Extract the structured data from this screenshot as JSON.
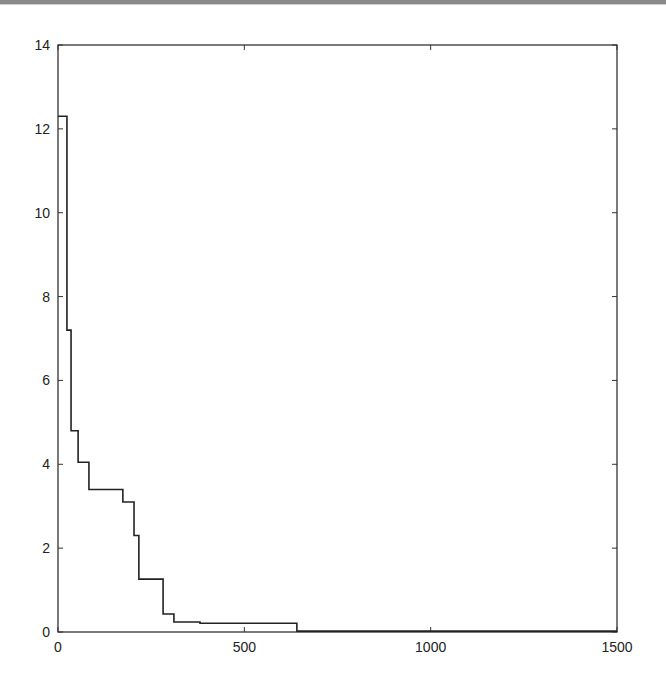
{
  "chart_data": {
    "type": "line",
    "subtype": "step",
    "title": "",
    "xlabel": "",
    "ylabel": "",
    "xlim": [
      0,
      1500
    ],
    "ylim": [
      0,
      14
    ],
    "grid": false,
    "legend": null,
    "x_ticks": [
      0,
      500,
      1000,
      1500
    ],
    "x_tick_labels": [
      "0",
      "500",
      "1000",
      "1500"
    ],
    "y_ticks": [
      0,
      2,
      4,
      6,
      8,
      10,
      12,
      14
    ],
    "y_tick_labels": [
      "0",
      "2",
      "4",
      "6",
      "8",
      "10",
      "12",
      "14"
    ],
    "series": [
      {
        "name": "step-curve",
        "color": "#222222",
        "x": [
          0,
          24,
          35,
          54,
          83,
          174,
          204,
          217,
          282,
          311,
          381,
          641,
          1500
        ],
        "y": [
          12.3,
          7.2,
          4.8,
          4.05,
          3.4,
          3.1,
          2.3,
          1.26,
          0.43,
          0.24,
          0.21,
          0.02,
          0.02
        ]
      }
    ]
  },
  "axes": {
    "frame_color": "#333333"
  }
}
